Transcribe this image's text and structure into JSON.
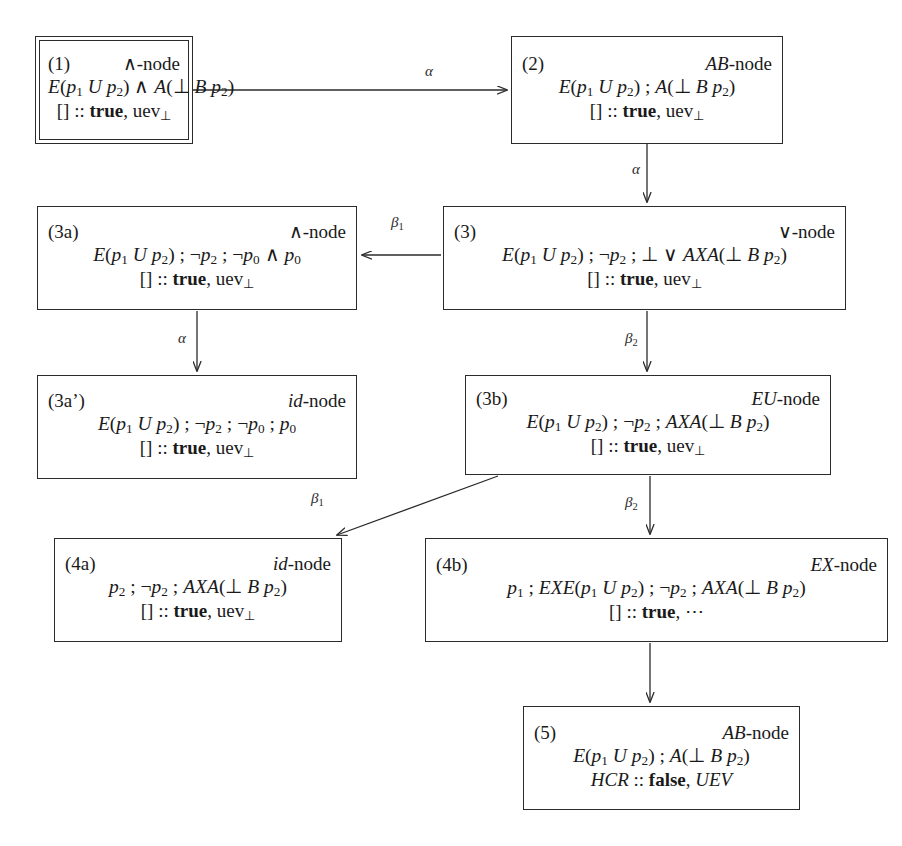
{
  "diagram": {
    "background": "#ffffff",
    "stroke": "#2b2b2b",
    "nodes": [
      {
        "key": "n1",
        "id": "(1)",
        "type": "∧-node",
        "formula_html": "<i>E</i>(<i>p</i><sub>1</sub> <i>U</i> <i>p</i><sub>2</sub>) ∧ <i>A</i>(⊥ <i>B</i> <i>p</i><sub>2</sub>)",
        "formula_text": "E(p1 U p2) ∧ A(⊥ B p2)",
        "status_html": "[] :: <b>true</b>, uev<sub>⊥</sub>",
        "status_text": "[] :: true, uev⊥",
        "double_border": true,
        "x": 35,
        "y": 36,
        "w": 158,
        "h": 108
      },
      {
        "key": "n2",
        "id": "(2)",
        "type": "<i>AB</i>-node",
        "type_text": "AB-node",
        "formula_html": "<i>E</i>(<i>p</i><sub>1</sub> <i>U</i> <i>p</i><sub>2</sub>) ; <i>A</i>(⊥ <i>B</i> <i>p</i><sub>2</sub>)",
        "formula_text": "E(p1 U p2) ; A(⊥ B p2)",
        "status_html": "[] :: <b>true</b>, uev<sub>⊥</sub>",
        "status_text": "[] :: true, uev⊥",
        "double_border": false,
        "x": 511,
        "y": 36,
        "w": 272,
        "h": 108
      },
      {
        "key": "n3a",
        "id": "(3a)",
        "type": "∧-node",
        "formula_html": "<i>E</i>(<i>p</i><sub>1</sub> <i>U</i> <i>p</i><sub>2</sub>) ; ¬<i>p</i><sub>2</sub> ; ¬<i>p</i><sub>0</sub> ∧ <i>p</i><sub>0</sub>",
        "formula_text": "E(p1 U p2) ; ¬p2 ; ¬p0 ∧ p0",
        "status_html": "[] :: <b>true</b>, uev<sub>⊥</sub>",
        "status_text": "[] :: true, uev⊥",
        "double_border": false,
        "x": 37,
        "y": 206,
        "w": 320,
        "h": 104
      },
      {
        "key": "n3",
        "id": "(3)",
        "type": "∨-node",
        "formula_html": "<i>E</i>(<i>p</i><sub>1</sub> <i>U</i> <i>p</i><sub>2</sub>) ; ¬<i>p</i><sub>2</sub> ; ⊥ ∨ <i>AXA</i>(⊥ <i>B</i> <i>p</i><sub>2</sub>)",
        "formula_text": "E(p1 U p2) ; ¬p2 ; ⊥ ∨ AXA(⊥ B p2)",
        "status_html": "[] :: <b>true</b>, uev<sub>⊥</sub>",
        "status_text": "[] :: true, uev⊥",
        "double_border": false,
        "x": 443,
        "y": 206,
        "w": 403,
        "h": 104
      },
      {
        "key": "n3ap",
        "id": "(3a’)",
        "type": "<i>id</i>-node",
        "type_text": "id-node",
        "formula_html": "<i>E</i>(<i>p</i><sub>1</sub> <i>U</i> <i>p</i><sub>2</sub>) ; ¬<i>p</i><sub>2</sub> ; ¬<i>p</i><sub>0</sub> ; <i>p</i><sub>0</sub>",
        "formula_text": "E(p1 U p2) ; ¬p2 ; ¬p0 ; p0",
        "status_html": "[] :: <b>true</b>, uev<sub>⊥</sub>",
        "status_text": "[] :: true, uev⊥",
        "double_border": false,
        "x": 37,
        "y": 375,
        "w": 320,
        "h": 104
      },
      {
        "key": "n3b",
        "id": "(3b)",
        "type": "<i>EU</i>-node",
        "type_text": "EU-node",
        "formula_html": "<i>E</i>(<i>p</i><sub>1</sub> <i>U</i> <i>p</i><sub>2</sub>) ; ¬<i>p</i><sub>2</sub> ; <i>AXA</i>(⊥ <i>B</i> <i>p</i><sub>2</sub>)",
        "formula_text": "E(p1 U p2) ; ¬p2 ; AXA(⊥ B p2)",
        "status_html": "[] :: <b>true</b>, uev<sub>⊥</sub>",
        "status_text": "[] :: true, uev⊥",
        "double_border": false,
        "x": 465,
        "y": 375,
        "w": 366,
        "h": 100
      },
      {
        "key": "n4a",
        "id": "(4a)",
        "type": "<i>id</i>-node",
        "type_text": "id-node",
        "formula_html": "<i>p</i><sub>2</sub> ; ¬<i>p</i><sub>2</sub> ; <i>AXA</i>(⊥ <i>B</i> <i>p</i><sub>2</sub>)",
        "formula_text": "p2 ; ¬p2 ; AXA(⊥ B p2)",
        "status_html": "[] :: <b>true</b>, uev<sub>⊥</sub>",
        "status_text": "[] :: true, uev⊥",
        "double_border": false,
        "x": 54,
        "y": 538,
        "w": 288,
        "h": 104
      },
      {
        "key": "n4b",
        "id": "(4b)",
        "type": "<i>EX</i>-node",
        "type_text": "EX-node",
        "formula_html": "<i>p</i><sub>1</sub> ; <i>EXE</i>(<i>p</i><sub>1</sub> <i>U</i> <i>p</i><sub>2</sub>) ; ¬<i>p</i><sub>2</sub> ; <i>AXA</i>(⊥ <i>B</i> <i>p</i><sub>2</sub>)",
        "formula_text": "p1 ; EXE(p1 U p2) ; ¬p2 ; AXA(⊥ B p2)",
        "status_html": "[] :: <b>true</b>, ⋯",
        "status_text": "[] :: true, ⋯",
        "double_border": false,
        "x": 425,
        "y": 538,
        "w": 463,
        "h": 104
      },
      {
        "key": "n5",
        "id": "(5)",
        "type": "<i>AB</i>-node",
        "type_text": "AB-node",
        "formula_html": "<i>E</i>(<i>p</i><sub>1</sub> <i>U</i> <i>p</i><sub>2</sub>) ; <i>A</i>(⊥ <i>B</i> <i>p</i><sub>2</sub>)",
        "formula_text": "E(p1 U p2) ; A(⊥ B p2)",
        "status_html": "<i>HCR</i> :: <b>false</b>, <i>UEV</i>",
        "status_text": "HCR :: false, UEV",
        "double_border": false,
        "x": 523,
        "y": 706,
        "w": 277,
        "h": 104
      }
    ],
    "edges": [
      {
        "key": "e1",
        "from": "(1)",
        "to": "(2)",
        "label_html": "α",
        "label_text": "α",
        "lx": 425,
        "ly": 63,
        "x1": 193,
        "y1": 90,
        "x2": 507,
        "y2": 90
      },
      {
        "key": "e2",
        "from": "(2)",
        "to": "(3)",
        "label_html": "α",
        "label_text": "α",
        "lx": 632,
        "ly": 161,
        "x1": 647,
        "y1": 144,
        "x2": 647,
        "y2": 202
      },
      {
        "key": "e3",
        "from": "(3)",
        "to": "(3a)",
        "label_html": "β<sub>1</sub>",
        "label_text": "β1",
        "lx": 391,
        "ly": 214,
        "x1": 441,
        "y1": 255,
        "x2": 362,
        "y2": 255
      },
      {
        "key": "e4",
        "from": "(3a)",
        "to": "(3a’)",
        "label_html": "α",
        "label_text": "α",
        "lx": 178,
        "ly": 330,
        "x1": 197,
        "y1": 311,
        "x2": 197,
        "y2": 371
      },
      {
        "key": "e5",
        "from": "(3)",
        "to": "(3b)",
        "label_html": "β<sub>2</sub>",
        "label_text": "β2",
        "lx": 625,
        "ly": 330,
        "x1": 647,
        "y1": 311,
        "x2": 647,
        "y2": 371
      },
      {
        "key": "e6",
        "from": "(3b)",
        "to": "(4a)",
        "label_html": "β<sub>1</sub>",
        "label_text": "β1",
        "lx": 311,
        "ly": 490,
        "x1": 498,
        "y1": 476,
        "x2": 337,
        "y2": 535
      },
      {
        "key": "e7",
        "from": "(3b)",
        "to": "(4b)",
        "label_html": "β<sub>2</sub>",
        "label_text": "β2",
        "lx": 625,
        "ly": 494,
        "x1": 650,
        "y1": 476,
        "x2": 650,
        "y2": 534
      },
      {
        "key": "e8",
        "from": "(4b)",
        "to": "(5)",
        "label_html": "",
        "label_text": "",
        "lx": 0,
        "ly": 0,
        "x1": 650,
        "y1": 643,
        "x2": 650,
        "y2": 702
      }
    ]
  }
}
